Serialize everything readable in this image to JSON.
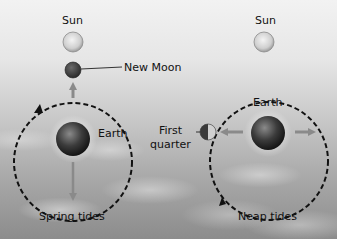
{
  "diagram": {
    "left_panel": {
      "caption": "Spring tides",
      "sun_label": "Sun",
      "moon_label": "New Moon",
      "earth_label": "Earth"
    },
    "right_panel": {
      "caption": "Neap tides",
      "sun_label": "Sun",
      "moon_label_line1": "First",
      "moon_label_line2": "quarter",
      "earth_label": "Earth"
    },
    "colors": {
      "orbit": "#111111",
      "moon": "#4a4a4a",
      "sun": "#d8d8d8",
      "arrow": "#8a8a8a"
    }
  }
}
